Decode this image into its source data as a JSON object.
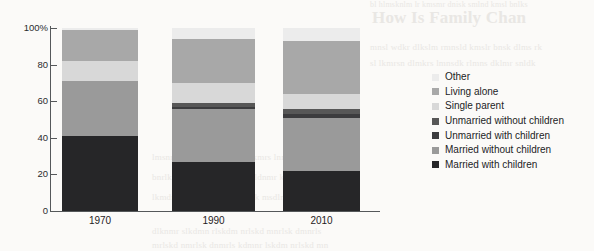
{
  "chart_data": {
    "type": "bar",
    "subtype": "stacked-percentage",
    "title": "",
    "xlabel": "",
    "ylabel": "",
    "categories": [
      "1970",
      "1990",
      "2010"
    ],
    "ylim": [
      0,
      100
    ],
    "ytick_values": [
      0,
      20,
      40,
      60,
      80,
      100
    ],
    "ytick_labels": [
      "0",
      "20",
      "40",
      "60",
      "80",
      "100%"
    ],
    "grid": false,
    "legend_position": "right",
    "stack_order_bottom_to_top": [
      "Married with children",
      "Married without children",
      "Unmarried with children",
      "Unmarried without children",
      "Single parent",
      "Living alone",
      "Other"
    ],
    "series": [
      {
        "name": "Married with children",
        "color": "#262628",
        "values": [
          41,
          27,
          22
        ]
      },
      {
        "name": "Married without children",
        "color": "#9a9a9a",
        "values": [
          30,
          29,
          29
        ]
      },
      {
        "name": "Unmarried with children",
        "color": "#3c3c3e",
        "values": [
          0,
          1,
          2
        ]
      },
      {
        "name": "Unmarried without children",
        "color": "#575757",
        "values": [
          0,
          2,
          3
        ]
      },
      {
        "name": "Single parent",
        "color": "#d8d8d8",
        "values": [
          11,
          11,
          8
        ]
      },
      {
        "name": "Living alone",
        "color": "#a8a8a8",
        "values": [
          17,
          24,
          29
        ]
      },
      {
        "name": "Other",
        "color": "#ececec",
        "values": [
          1,
          6,
          7
        ]
      }
    ]
  },
  "axis": {
    "ticks": [
      {
        "label": "100%",
        "value": 100
      },
      {
        "label": "80",
        "value": 80
      },
      {
        "label": "60",
        "value": 60
      },
      {
        "label": "40",
        "value": 40
      },
      {
        "label": "20",
        "value": 20
      },
      {
        "label": "0",
        "value": 0
      }
    ]
  },
  "legend": {
    "items": [
      {
        "label": "Other",
        "color": "#ececec"
      },
      {
        "label": "Living alone",
        "color": "#a8a8a8"
      },
      {
        "label": "Single parent",
        "color": "#d8d8d8"
      },
      {
        "label": "Unmarried without children",
        "color": "#575757"
      },
      {
        "label": "Unmarried with children",
        "color": "#3c3c3e"
      },
      {
        "label": "Married without children",
        "color": "#9a9a9a"
      },
      {
        "label": "Married with children",
        "color": "#262628"
      }
    ]
  },
  "background_text": {
    "heading": "How Is Family Chan",
    "lines": [
      "bl hlmsknlm lr kmsmr dnisk smlnd kmsl bnlks",
      "mnsl wdkr dlkslm rmnsld kmslr bnsk dlms rk",
      "sl lkmrsn dlmkrs lmnsdk rlmns dklmr snldk",
      "lmsnr dklm snrdlk mrslnd kmrs lnmdk rslmn",
      "bnrlk msdlnr kmsdl nrmks ldnmr kslmd nrks",
      "lkmdns rlkmsd nlrkm sdlnrk msdln rkmsl dnr",
      "dlknmr slkdmn rlskdm nrlskd mnrlsk dmnrls",
      "mrlskd nmrlsk dnmrls kdmnr lskdm nrlskd mn"
    ]
  }
}
